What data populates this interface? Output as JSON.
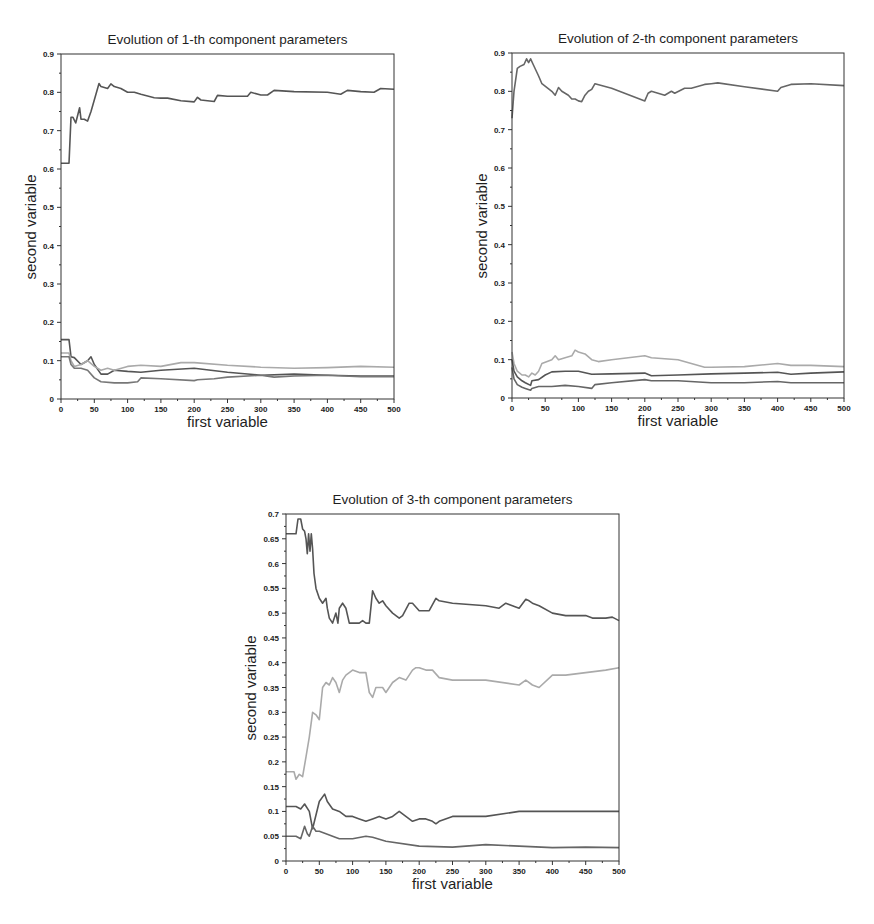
{
  "chart_data": [
    {
      "type": "line",
      "title": "Evolution of 1-th component parameters",
      "xlabel": "first variable",
      "ylabel": "second variable",
      "xlim": [
        0,
        500
      ],
      "ylim": [
        0,
        0.9
      ],
      "xticks": [
        0,
        50,
        100,
        150,
        200,
        250,
        300,
        350,
        400,
        450,
        500
      ],
      "yticks": [
        0,
        0.1,
        0.2,
        0.3,
        0.4,
        0.5,
        0.6,
        0.7,
        0.8,
        0.9
      ],
      "ytick_labels": [
        "0",
        "0.1",
        "0.2",
        "0.3",
        "0.4",
        "0.5",
        "0.6",
        "0.7",
        "0.8",
        "0.9"
      ],
      "grid": false,
      "legend": null,
      "series": [
        {
          "name": "series-1",
          "color": "#555555",
          "x": [
            0,
            12,
            15,
            18,
            22,
            28,
            30,
            35,
            40,
            45,
            50,
            57,
            60,
            70,
            75,
            80,
            90,
            100,
            110,
            120,
            140,
            150,
            160,
            180,
            200,
            205,
            210,
            230,
            235,
            250,
            280,
            285,
            300,
            310,
            320,
            350,
            400,
            420,
            430,
            450,
            470,
            480,
            500
          ],
          "y": [
            0.615,
            0.615,
            0.735,
            0.735,
            0.72,
            0.76,
            0.73,
            0.73,
            0.725,
            0.75,
            0.78,
            0.823,
            0.815,
            0.81,
            0.822,
            0.815,
            0.81,
            0.8,
            0.8,
            0.795,
            0.786,
            0.785,
            0.785,
            0.778,
            0.775,
            0.787,
            0.78,
            0.776,
            0.792,
            0.79,
            0.79,
            0.8,
            0.793,
            0.793,
            0.805,
            0.802,
            0.8,
            0.795,
            0.805,
            0.802,
            0.8,
            0.81,
            0.808
          ]
        },
        {
          "name": "series-2",
          "color": "#555555",
          "x": [
            0,
            12,
            15,
            20,
            30,
            40,
            45,
            50,
            60,
            70,
            80,
            100,
            120,
            150,
            200,
            250,
            300,
            350,
            400,
            450,
            500
          ],
          "y": [
            0.155,
            0.155,
            0.11,
            0.108,
            0.09,
            0.1,
            0.11,
            0.09,
            0.065,
            0.065,
            0.075,
            0.072,
            0.07,
            0.075,
            0.08,
            0.07,
            0.062,
            0.065,
            0.062,
            0.06,
            0.06
          ]
        },
        {
          "name": "series-3",
          "color": "#aaaaaa",
          "x": [
            0,
            12,
            15,
            20,
            30,
            40,
            50,
            60,
            70,
            80,
            100,
            120,
            150,
            180,
            200,
            250,
            300,
            350,
            400,
            450,
            500
          ],
          "y": [
            0.12,
            0.12,
            0.1,
            0.085,
            0.09,
            0.1,
            0.085,
            0.075,
            0.08,
            0.075,
            0.085,
            0.088,
            0.085,
            0.095,
            0.095,
            0.088,
            0.083,
            0.08,
            0.082,
            0.085,
            0.083
          ]
        },
        {
          "name": "series-4",
          "color": "#777777",
          "x": [
            0,
            12,
            15,
            20,
            30,
            40,
            50,
            60,
            80,
            100,
            115,
            120,
            150,
            200,
            205,
            230,
            250,
            300,
            320,
            350,
            400,
            450,
            500
          ],
          "y": [
            0.11,
            0.11,
            0.09,
            0.08,
            0.08,
            0.075,
            0.055,
            0.045,
            0.042,
            0.042,
            0.045,
            0.055,
            0.053,
            0.048,
            0.05,
            0.053,
            0.057,
            0.062,
            0.057,
            0.06,
            0.062,
            0.058,
            0.058
          ]
        }
      ]
    },
    {
      "type": "line",
      "title": "Evolution of 2-th component parameters",
      "xlabel": "first variable",
      "ylabel": "second variable",
      "xlim": [
        0,
        500
      ],
      "ylim": [
        0,
        0.9
      ],
      "xticks": [
        0,
        50,
        100,
        150,
        200,
        250,
        300,
        350,
        400,
        450,
        500
      ],
      "yticks": [
        0,
        0.1,
        0.2,
        0.3,
        0.4,
        0.5,
        0.6,
        0.7,
        0.8,
        0.9
      ],
      "ytick_labels": [
        "0",
        "0.1",
        "0.2",
        "0.3",
        "0.4",
        "0.5",
        "0.6",
        "0.7",
        "0.8",
        "0.9"
      ],
      "grid": false,
      "legend": null,
      "series": [
        {
          "name": "series-1",
          "color": "#666666",
          "x": [
            0,
            3,
            8,
            12,
            18,
            22,
            25,
            28,
            32,
            40,
            45,
            60,
            65,
            70,
            75,
            85,
            90,
            95,
            100,
            105,
            110,
            115,
            120,
            125,
            150,
            200,
            205,
            210,
            230,
            240,
            245,
            260,
            270,
            290,
            300,
            310,
            350,
            400,
            405,
            420,
            450,
            500
          ],
          "y": [
            0.73,
            0.8,
            0.86,
            0.865,
            0.87,
            0.885,
            0.875,
            0.885,
            0.87,
            0.84,
            0.82,
            0.8,
            0.79,
            0.81,
            0.8,
            0.79,
            0.78,
            0.78,
            0.775,
            0.773,
            0.79,
            0.8,
            0.805,
            0.82,
            0.808,
            0.775,
            0.795,
            0.8,
            0.79,
            0.8,
            0.795,
            0.808,
            0.808,
            0.818,
            0.82,
            0.822,
            0.812,
            0.8,
            0.81,
            0.818,
            0.82,
            0.815
          ]
        },
        {
          "name": "series-2",
          "color": "#aaaaaa",
          "x": [
            0,
            3,
            8,
            15,
            20,
            25,
            30,
            35,
            40,
            45,
            60,
            65,
            70,
            80,
            90,
            95,
            100,
            110,
            120,
            130,
            150,
            200,
            210,
            250,
            290,
            300,
            350,
            400,
            420,
            450,
            500
          ],
          "y": [
            0.12,
            0.09,
            0.07,
            0.06,
            0.06,
            0.055,
            0.065,
            0.06,
            0.07,
            0.09,
            0.1,
            0.11,
            0.1,
            0.105,
            0.11,
            0.125,
            0.12,
            0.115,
            0.1,
            0.095,
            0.1,
            0.11,
            0.105,
            0.1,
            0.08,
            0.08,
            0.082,
            0.09,
            0.085,
            0.085,
            0.082
          ]
        },
        {
          "name": "series-3",
          "color": "#555555",
          "x": [
            0,
            3,
            8,
            15,
            20,
            28,
            30,
            40,
            50,
            60,
            80,
            100,
            120,
            150,
            200,
            210,
            250,
            300,
            350,
            400,
            420,
            450,
            500
          ],
          "y": [
            0.1,
            0.07,
            0.055,
            0.045,
            0.04,
            0.033,
            0.045,
            0.048,
            0.06,
            0.068,
            0.07,
            0.07,
            0.062,
            0.063,
            0.065,
            0.058,
            0.06,
            0.063,
            0.065,
            0.067,
            0.062,
            0.065,
            0.068
          ]
        },
        {
          "name": "series-4",
          "color": "#666666",
          "x": [
            0,
            3,
            8,
            15,
            20,
            28,
            30,
            40,
            60,
            80,
            100,
            120,
            125,
            150,
            200,
            210,
            250,
            300,
            350,
            400,
            420,
            450,
            500
          ],
          "y": [
            0.08,
            0.05,
            0.035,
            0.028,
            0.025,
            0.02,
            0.025,
            0.03,
            0.03,
            0.033,
            0.03,
            0.025,
            0.035,
            0.04,
            0.048,
            0.045,
            0.045,
            0.04,
            0.04,
            0.043,
            0.04,
            0.04,
            0.04
          ]
        }
      ]
    },
    {
      "type": "line",
      "title": "Evolution of 3-th component parameters",
      "xlabel": "first variable",
      "ylabel": "second variable",
      "xlim": [
        0,
        500
      ],
      "ylim": [
        0,
        0.7
      ],
      "xticks": [
        0,
        50,
        100,
        150,
        200,
        250,
        300,
        350,
        400,
        450,
        500
      ],
      "yticks": [
        0,
        0.05,
        0.1,
        0.15,
        0.2,
        0.25,
        0.3,
        0.35,
        0.4,
        0.45,
        0.5,
        0.55,
        0.6,
        0.65,
        0.7
      ],
      "ytick_labels": [
        "0",
        "0.05",
        "0.1",
        "0.15",
        "0.2",
        "0.25",
        "0.3",
        "0.35",
        "0.4",
        "0.45",
        "0.5",
        "0.55",
        "0.6",
        "0.65",
        "0.7"
      ],
      "grid": false,
      "legend": null,
      "series": [
        {
          "name": "series-1",
          "color": "#555555",
          "x": [
            0,
            15,
            18,
            22,
            25,
            28,
            30,
            32,
            34,
            36,
            38,
            40,
            42,
            45,
            50,
            55,
            60,
            62,
            65,
            70,
            75,
            78,
            80,
            85,
            90,
            95,
            100,
            110,
            115,
            120,
            125,
            130,
            135,
            140,
            145,
            150,
            160,
            170,
            175,
            185,
            190,
            200,
            215,
            225,
            230,
            250,
            300,
            320,
            330,
            340,
            350,
            360,
            365,
            370,
            380,
            400,
            420,
            450,
            460,
            480,
            490,
            500
          ],
          "y": [
            0.66,
            0.66,
            0.69,
            0.69,
            0.67,
            0.665,
            0.65,
            0.62,
            0.66,
            0.625,
            0.66,
            0.63,
            0.58,
            0.55,
            0.53,
            0.52,
            0.53,
            0.51,
            0.49,
            0.48,
            0.5,
            0.48,
            0.51,
            0.52,
            0.51,
            0.48,
            0.48,
            0.48,
            0.485,
            0.48,
            0.48,
            0.545,
            0.53,
            0.52,
            0.525,
            0.515,
            0.5,
            0.49,
            0.495,
            0.52,
            0.52,
            0.505,
            0.505,
            0.53,
            0.525,
            0.52,
            0.515,
            0.51,
            0.52,
            0.515,
            0.51,
            0.528,
            0.525,
            0.52,
            0.515,
            0.5,
            0.495,
            0.495,
            0.49,
            0.49,
            0.492,
            0.485
          ]
        },
        {
          "name": "series-2",
          "color": "#aaaaaa",
          "x": [
            0,
            12,
            15,
            20,
            25,
            30,
            35,
            40,
            45,
            50,
            55,
            60,
            65,
            70,
            75,
            80,
            85,
            90,
            95,
            100,
            110,
            120,
            125,
            130,
            135,
            145,
            150,
            160,
            170,
            180,
            190,
            195,
            200,
            210,
            220,
            230,
            250,
            300,
            350,
            360,
            370,
            380,
            400,
            420,
            450,
            480,
            500
          ],
          "y": [
            0.18,
            0.18,
            0.165,
            0.175,
            0.17,
            0.21,
            0.25,
            0.3,
            0.295,
            0.285,
            0.35,
            0.36,
            0.355,
            0.37,
            0.36,
            0.34,
            0.365,
            0.375,
            0.38,
            0.385,
            0.38,
            0.38,
            0.34,
            0.33,
            0.35,
            0.35,
            0.34,
            0.36,
            0.37,
            0.365,
            0.385,
            0.39,
            0.39,
            0.385,
            0.385,
            0.37,
            0.365,
            0.365,
            0.355,
            0.365,
            0.355,
            0.35,
            0.375,
            0.375,
            0.38,
            0.385,
            0.39
          ]
        },
        {
          "name": "series-3",
          "color": "#555555",
          "x": [
            0,
            15,
            22,
            28,
            35,
            40,
            50,
            58,
            62,
            70,
            80,
            90,
            100,
            110,
            120,
            130,
            140,
            150,
            160,
            170,
            190,
            200,
            210,
            220,
            225,
            230,
            250,
            300,
            350,
            400,
            450,
            500
          ],
          "y": [
            0.11,
            0.11,
            0.105,
            0.115,
            0.1,
            0.065,
            0.12,
            0.135,
            0.12,
            0.105,
            0.1,
            0.09,
            0.09,
            0.085,
            0.08,
            0.085,
            0.09,
            0.085,
            0.09,
            0.1,
            0.08,
            0.085,
            0.085,
            0.08,
            0.075,
            0.08,
            0.09,
            0.09,
            0.1,
            0.1,
            0.1,
            0.1
          ]
        },
        {
          "name": "series-4",
          "color": "#666666",
          "x": [
            0,
            15,
            22,
            28,
            32,
            35,
            40,
            45,
            50,
            60,
            70,
            80,
            100,
            120,
            130,
            150,
            200,
            250,
            300,
            350,
            400,
            450,
            500
          ],
          "y": [
            0.05,
            0.05,
            0.045,
            0.07,
            0.055,
            0.05,
            0.07,
            0.06,
            0.06,
            0.055,
            0.05,
            0.045,
            0.045,
            0.05,
            0.048,
            0.04,
            0.03,
            0.028,
            0.033,
            0.03,
            0.027,
            0.028,
            0.027
          ]
        }
      ]
    }
  ],
  "layout_panels": [
    {
      "plot": {
        "left": 61,
        "top": 54,
        "right": 394,
        "bottom": 399
      }
    },
    {
      "plot": {
        "left": 512,
        "top": 53,
        "right": 844,
        "bottom": 398
      }
    },
    {
      "plot": {
        "left": 286,
        "top": 514,
        "right": 619,
        "bottom": 861
      }
    }
  ]
}
